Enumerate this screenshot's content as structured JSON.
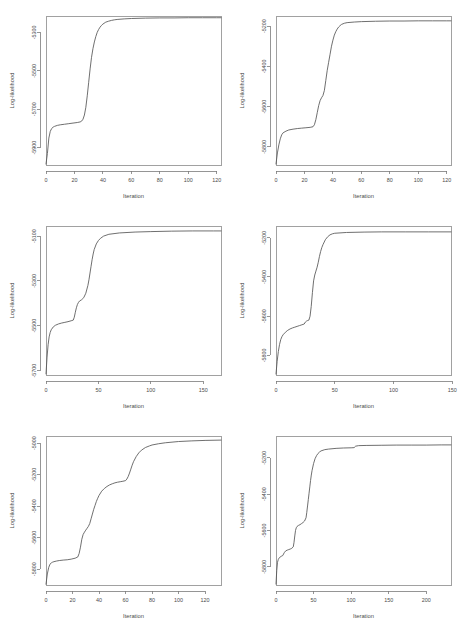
{
  "figure": {
    "layout": "2 columns x 3 rows of line plots",
    "background": "#ffffff",
    "line_color": "#555555",
    "axis_color": "#7a7a7a",
    "text_color": "#4a4a4a"
  },
  "chart_data": [
    {
      "id": "plot-top-left",
      "type": "line",
      "title": "",
      "xlabel": "Iteration",
      "ylabel": "Log-likelihood",
      "xlim": [
        0,
        123
      ],
      "ylim": [
        -5990,
        -5215
      ],
      "xticks": [
        0,
        20,
        40,
        60,
        80,
        100,
        120
      ],
      "xtick_labels": [
        "0",
        "20",
        "40",
        "60",
        "80",
        "100",
        "120"
      ],
      "yticks": [
        -5300,
        -5500,
        -5700,
        -5900
      ],
      "ytick_labels": [
        "-5300",
        "-5500",
        "-5700",
        "-5900"
      ],
      "grid": false,
      "legend": "none",
      "x": [
        0,
        1,
        2,
        3,
        4,
        5,
        6,
        8,
        10,
        13,
        16,
        19,
        22,
        24,
        25,
        26,
        27,
        28,
        29,
        30,
        31,
        32,
        33,
        34,
        35,
        36,
        37,
        38,
        39,
        40,
        42,
        44,
        46,
        48,
        50,
        55,
        60,
        70,
        80,
        90,
        100,
        110,
        120,
        123
      ],
      "y": [
        -5985,
        -5930,
        -5850,
        -5815,
        -5800,
        -5793,
        -5789,
        -5784,
        -5781,
        -5778,
        -5775,
        -5772,
        -5769,
        -5766,
        -5762,
        -5752,
        -5730,
        -5690,
        -5630,
        -5560,
        -5490,
        -5430,
        -5385,
        -5350,
        -5322,
        -5300,
        -5285,
        -5273,
        -5264,
        -5257,
        -5247,
        -5242,
        -5238,
        -5235,
        -5233,
        -5230,
        -5228,
        -5226,
        -5225,
        -5225,
        -5224,
        -5224,
        -5224,
        -5224
      ]
    },
    {
      "id": "plot-top-right",
      "type": "line",
      "title": "",
      "xlabel": "Iteration",
      "ylabel": "Log-likelihood",
      "xlim": [
        0,
        123
      ],
      "ylim": [
        -5890,
        -5150
      ],
      "xticks": [
        0,
        20,
        40,
        60,
        80,
        100,
        120
      ],
      "xtick_labels": [
        "0",
        "20",
        "40",
        "60",
        "80",
        "100",
        "120"
      ],
      "yticks": [
        -5200,
        -5400,
        -5600,
        -5800
      ],
      "ytick_labels": [
        "-5200",
        "-5400",
        "-5600",
        "-5800"
      ],
      "grid": false,
      "legend": "none",
      "x": [
        0,
        1,
        2,
        3,
        4,
        5,
        7,
        9,
        12,
        15,
        18,
        21,
        24,
        26,
        27,
        28,
        29,
        30,
        31,
        32,
        33,
        34,
        35,
        36,
        37,
        38,
        39,
        40,
        41,
        42,
        43,
        44,
        45,
        46,
        48,
        50,
        55,
        60,
        70,
        80,
        90,
        100,
        110,
        120,
        123
      ],
      "y": [
        -5885,
        -5830,
        -5790,
        -5760,
        -5740,
        -5730,
        -5722,
        -5716,
        -5712,
        -5709,
        -5707,
        -5705,
        -5703,
        -5700,
        -5690,
        -5665,
        -5630,
        -5595,
        -5570,
        -5556,
        -5545,
        -5520,
        -5470,
        -5420,
        -5380,
        -5340,
        -5300,
        -5270,
        -5245,
        -5228,
        -5215,
        -5205,
        -5198,
        -5192,
        -5186,
        -5183,
        -5180,
        -5178,
        -5176,
        -5175,
        -5175,
        -5174,
        -5174,
        -5174,
        -5174
      ]
    },
    {
      "id": "plot-middle-left",
      "type": "line",
      "title": "",
      "xlabel": "Iteration",
      "ylabel": "Log-likelihood",
      "xlim": [
        0,
        167
      ],
      "ylim": [
        -5720,
        -5055
      ],
      "xticks": [
        0,
        50,
        100,
        150
      ],
      "xtick_labels": [
        "0",
        "50",
        "100",
        "150"
      ],
      "yticks": [
        -5100,
        -5300,
        -5500,
        -5700
      ],
      "ytick_labels": [
        "-5100",
        "-5300",
        "-5500",
        "-5700"
      ],
      "grid": false,
      "legend": "none",
      "x": [
        0,
        1,
        2,
        3,
        4,
        5,
        7,
        9,
        12,
        15,
        18,
        21,
        24,
        26,
        27,
        28,
        29,
        30,
        31,
        32,
        34,
        36,
        38,
        40,
        41,
        42,
        43,
        44,
        45,
        46,
        48,
        50,
        52,
        55,
        60,
        70,
        85,
        100,
        120,
        140,
        160,
        167
      ],
      "y": [
        -5715,
        -5640,
        -5585,
        -5550,
        -5530,
        -5518,
        -5505,
        -5498,
        -5492,
        -5488,
        -5485,
        -5482,
        -5478,
        -5475,
        -5462,
        -5440,
        -5420,
        -5405,
        -5396,
        -5390,
        -5384,
        -5375,
        -5355,
        -5320,
        -5295,
        -5265,
        -5235,
        -5205,
        -5180,
        -5160,
        -5135,
        -5120,
        -5110,
        -5100,
        -5092,
        -5086,
        -5082,
        -5080,
        -5078,
        -5077,
        -5077,
        -5077
      ]
    },
    {
      "id": "plot-middle-right",
      "type": "line",
      "title": "",
      "xlabel": "Iteration",
      "ylabel": "Log-likelihood",
      "xlim": [
        0,
        149
      ],
      "ylim": [
        -5900,
        -5140
      ],
      "xticks": [
        0,
        50,
        100,
        150
      ],
      "xtick_labels": [
        "0",
        "50",
        "100",
        "150"
      ],
      "yticks": [
        -5200,
        -5400,
        -5600,
        -5800
      ],
      "ytick_labels": [
        "-5200",
        "-5400",
        "-5600",
        "-5800"
      ],
      "grid": false,
      "legend": "none",
      "x": [
        0,
        1,
        2,
        3,
        4,
        5,
        6,
        8,
        10,
        12,
        14,
        16,
        18,
        20,
        22,
        24,
        25,
        26,
        27,
        28,
        29,
        30,
        31,
        32,
        33,
        34,
        35,
        36,
        37,
        38,
        39,
        40,
        42,
        44,
        46,
        48,
        50,
        60,
        75,
        90,
        110,
        130,
        149
      ],
      "y": [
        -5895,
        -5830,
        -5780,
        -5745,
        -5720,
        -5705,
        -5695,
        -5682,
        -5672,
        -5665,
        -5660,
        -5656,
        -5652,
        -5648,
        -5644,
        -5640,
        -5630,
        -5625,
        -5622,
        -5620,
        -5600,
        -5550,
        -5480,
        -5420,
        -5390,
        -5370,
        -5350,
        -5325,
        -5295,
        -5270,
        -5250,
        -5235,
        -5210,
        -5195,
        -5185,
        -5180,
        -5177,
        -5173,
        -5171,
        -5170,
        -5170,
        -5170,
        -5170
      ]
    },
    {
      "id": "plot-bottom-left",
      "type": "line",
      "title": "",
      "xlabel": "Iteration",
      "ylabel": "Log-likelihood",
      "xlim": [
        0,
        132
      ],
      "ylim": [
        -5900,
        -4955
      ],
      "xticks": [
        0,
        20,
        40,
        60,
        80,
        100,
        120
      ],
      "xtick_labels": [
        "0",
        "20",
        "40",
        "60",
        "80",
        "100",
        "120"
      ],
      "yticks": [
        -5000,
        -5200,
        -5400,
        -5600,
        -5800
      ],
      "ytick_labels": [
        "-5000",
        "-5200",
        "-5400",
        "-5600",
        "-5800"
      ],
      "grid": false,
      "legend": "none",
      "x": [
        0,
        1,
        2,
        3,
        4,
        5,
        6,
        8,
        10,
        13,
        16,
        19,
        22,
        24,
        25,
        26,
        27,
        28,
        29,
        30,
        31,
        32,
        33,
        34,
        35,
        36,
        37,
        38,
        39,
        40,
        42,
        44,
        46,
        48,
        50,
        52,
        54,
        56,
        58,
        60,
        61,
        62,
        63,
        64,
        65,
        66,
        68,
        70,
        72,
        75,
        78,
        80,
        85,
        90,
        100,
        110,
        120,
        132
      ],
      "y": [
        -5895,
        -5830,
        -5790,
        -5768,
        -5760,
        -5755,
        -5752,
        -5748,
        -5745,
        -5742,
        -5740,
        -5736,
        -5730,
        -5722,
        -5700,
        -5660,
        -5610,
        -5580,
        -5565,
        -5552,
        -5540,
        -5528,
        -5510,
        -5480,
        -5450,
        -5420,
        -5395,
        -5370,
        -5350,
        -5332,
        -5305,
        -5288,
        -5275,
        -5265,
        -5258,
        -5252,
        -5248,
        -5245,
        -5242,
        -5238,
        -5228,
        -5212,
        -5190,
        -5165,
        -5140,
        -5118,
        -5086,
        -5062,
        -5045,
        -5028,
        -5018,
        -5012,
        -5004,
        -4998,
        -4990,
        -4986,
        -4983,
        -4981
      ]
    },
    {
      "id": "plot-bottom-right",
      "type": "line",
      "title": "",
      "xlabel": "Iteration",
      "ylabel": "Log-likelihood",
      "xlim": [
        0,
        233
      ],
      "ylim": [
        -5900,
        -5080
      ],
      "xticks": [
        0,
        50,
        100,
        150,
        200
      ],
      "xtick_labels": [
        "0",
        "50",
        "100",
        "150",
        "200"
      ],
      "yticks": [
        -5200,
        -5400,
        -5600,
        -5800
      ],
      "ytick_labels": [
        "-5200",
        "-5400",
        "-5600",
        "-5800"
      ],
      "grid": false,
      "legend": "none",
      "x": [
        0,
        1,
        2,
        3,
        4,
        5,
        7,
        9,
        11,
        13,
        15,
        17,
        19,
        21,
        23,
        24,
        25,
        26,
        27,
        28,
        30,
        32,
        34,
        36,
        38,
        40,
        41,
        42,
        43,
        44,
        45,
        46,
        47,
        48,
        50,
        52,
        54,
        56,
        58,
        60,
        65,
        70,
        80,
        90,
        100,
        104,
        106,
        110,
        120,
        140,
        160,
        180,
        200,
        220,
        233
      ],
      "y": [
        -5895,
        -5820,
        -5775,
        -5760,
        -5752,
        -5748,
        -5742,
        -5738,
        -5722,
        -5712,
        -5708,
        -5705,
        -5702,
        -5698,
        -5690,
        -5665,
        -5630,
        -5600,
        -5585,
        -5578,
        -5572,
        -5568,
        -5562,
        -5556,
        -5548,
        -5530,
        -5500,
        -5465,
        -5430,
        -5395,
        -5360,
        -5325,
        -5295,
        -5270,
        -5232,
        -5205,
        -5188,
        -5176,
        -5168,
        -5162,
        -5155,
        -5152,
        -5148,
        -5146,
        -5145,
        -5144,
        -5136,
        -5133,
        -5132,
        -5131,
        -5130,
        -5130,
        -5130,
        -5129,
        -5129
      ]
    }
  ]
}
